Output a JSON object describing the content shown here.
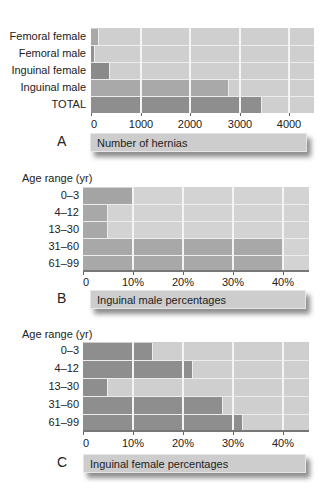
{
  "colors": {
    "plot_bg": "#cfcfcf",
    "bar_dark": "#8c8c8c",
    "bar_mid": "#a6a6a6",
    "gridline": "#f4f4f4",
    "caption_bg": "#cdcdcd"
  },
  "panels": [
    {
      "letter": "A",
      "caption": "Number of hernias",
      "ytitle": ""
    },
    {
      "letter": "B",
      "caption": "Inguinal male percentages",
      "ytitle": "Age range (yr)"
    },
    {
      "letter": "C",
      "caption": "Inguinal female percentages",
      "ytitle": "Age range (yr)"
    }
  ],
  "chart_data": [
    {
      "type": "bar",
      "orientation": "horizontal",
      "panel": "A",
      "title": "",
      "xlabel": "Number of hernias",
      "ylabel": "",
      "categories": [
        "Femoral female",
        "Femoral male",
        "Inguinal female",
        "Inguinal male",
        "TOTAL"
      ],
      "values": [
        160,
        90,
        380,
        2790,
        3450
      ],
      "xlim": [
        0,
        4450
      ],
      "xticks": [
        0,
        1000,
        2000,
        3000,
        4000
      ],
      "xtick_labels": [
        "0",
        "1000",
        "2000",
        "3000",
        "4000"
      ],
      "grid": true,
      "legend": null
    },
    {
      "type": "bar",
      "orientation": "horizontal",
      "panel": "B",
      "title": "",
      "xlabel": "Inguinal male percentages",
      "ylabel": "Age range (yr)",
      "categories": [
        "0–3",
        "4–12",
        "13–30",
        "31–60",
        "61–99"
      ],
      "values": [
        10,
        5,
        5,
        40,
        40
      ],
      "xlim": [
        0,
        45
      ],
      "xticks": [
        0,
        10,
        20,
        30,
        40
      ],
      "xtick_labels": [
        "0",
        "10%",
        "20%",
        "30%",
        "40%"
      ],
      "grid": true,
      "legend": null
    },
    {
      "type": "bar",
      "orientation": "horizontal",
      "panel": "C",
      "title": "",
      "xlabel": "Inguinal female percentages",
      "ylabel": "Age range (yr)",
      "categories": [
        "0–3",
        "4–12",
        "13–30",
        "31–60",
        "61–99"
      ],
      "values": [
        14,
        22,
        5,
        28,
        32
      ],
      "xlim": [
        0,
        45
      ],
      "xticks": [
        0,
        10,
        20,
        30,
        40
      ],
      "xtick_labels": [
        "0",
        "10%",
        "20%",
        "30%",
        "40%"
      ],
      "grid": true,
      "legend": null
    }
  ]
}
